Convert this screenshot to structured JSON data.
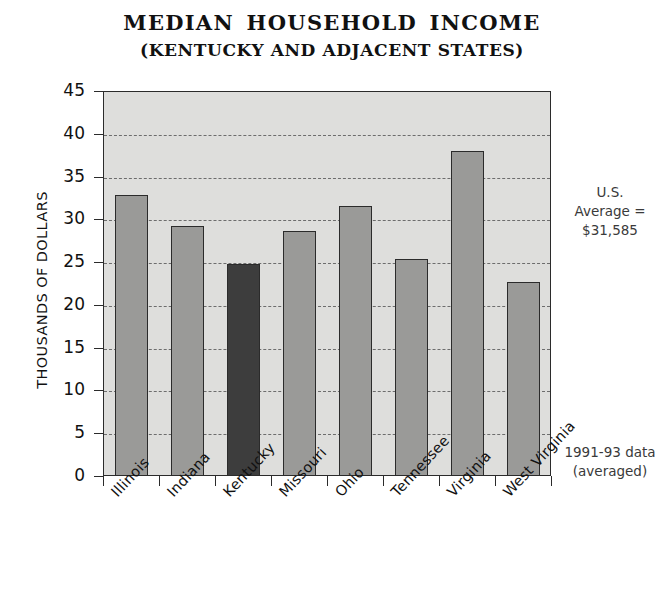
{
  "chart_data": {
    "type": "bar",
    "title": "MEDIAN  HOUSEHOLD  INCOME",
    "subtitle": "(KENTUCKY AND ADJACENT STATES)",
    "xlabel": "",
    "ylabel": "THOUSANDS OF DOLLARS",
    "categories": [
      "Illinois",
      "Indiana",
      "Kentucky",
      "Missouri",
      "Ohio",
      "Tennessee",
      "Virginia",
      "West Virginia"
    ],
    "values": [
      32.8,
      29.2,
      24.8,
      28.6,
      31.6,
      25.4,
      38.0,
      22.7
    ],
    "ylim": [
      0,
      45
    ],
    "ytick_labels": [
      "45",
      "40",
      "35",
      "30",
      "25",
      "20",
      "15",
      "10",
      "5",
      "0"
    ],
    "ytick_values": [
      45,
      40,
      35,
      30,
      25,
      20,
      15,
      10,
      5,
      0
    ],
    "grid": true,
    "legend": "none",
    "highlight_category": "Kentucky",
    "bar_color": "#9a9a98",
    "highlight_bar_color": "#3d3d3d",
    "plot_background": "#dededc",
    "axis_color": "#2b2b2b",
    "gridline_color": "#6d6d6d",
    "annotations": {
      "us_average": {
        "line1": "U.S.",
        "line2": "Average =",
        "line3": "$31,585",
        "value": 31.585
      },
      "data_period": {
        "line1": "1991-93 data",
        "line2": "(averaged)"
      }
    }
  }
}
